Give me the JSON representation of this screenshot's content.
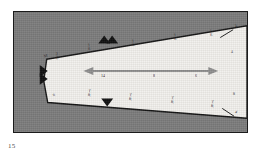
{
  "figure": {
    "caption": "15",
    "colors": {
      "background_field": "#7c7c7c",
      "wedge_fill": "#f2f0ec",
      "outline": "#141414",
      "frame": "#1b1b1b",
      "dimension_arrow": "#8e8e8e",
      "marker": "#101010",
      "label_text": "#22201f"
    },
    "shape": {
      "name": "tapered-wedge",
      "description": "light tapered wedge widening to the right on a dark gray field"
    }
  },
  "dimension_arrow": {
    "name": "overall-length-dimension",
    "labels": [
      {
        "text": "14",
        "x": 104,
        "y": 76
      },
      {
        "text": "8",
        "x": 156,
        "y": 76
      },
      {
        "text": "6",
        "x": 198,
        "y": 76
      }
    ]
  },
  "edge_markers": [
    {
      "name": "station-marker-top",
      "x": 108,
      "y": 41,
      "kind": "double-triangle"
    },
    {
      "name": "station-marker-left",
      "x": 46,
      "y": 72,
      "kind": "double-triangle"
    },
    {
      "name": "station-marker-bottom",
      "x": 110,
      "y": 106,
      "kind": "triangle"
    }
  ],
  "annotations": {
    "top_row": [
      {
        "text": "1\nE",
        "x": 92,
        "y": 47
      },
      {
        "text": "1\nE",
        "x": 136,
        "y": 43
      },
      {
        "text": "1\nE",
        "x": 178,
        "y": 37
      },
      {
        "text": "1\nE",
        "x": 214,
        "y": 33
      }
    ],
    "upper_mid_row": [
      {
        "text": "2\nE",
        "x": 60,
        "y": 56
      }
    ],
    "right_column": [
      {
        "text": "4",
        "x": 234,
        "y": 52
      },
      {
        "text": "8",
        "x": 236,
        "y": 94
      }
    ],
    "bottom_row": [
      {
        "text": "T\nR",
        "x": 92,
        "y": 93
      },
      {
        "text": "T\nR",
        "x": 133,
        "y": 97
      },
      {
        "text": "T\nR",
        "x": 175,
        "y": 100
      },
      {
        "text": "T\nR",
        "x": 215,
        "y": 104
      }
    ],
    "bottom_left": [
      {
        "text": "6",
        "x": 57,
        "y": 97
      }
    ],
    "left_corner": [
      {
        "text": "M",
        "x": 48,
        "y": 58
      }
    ]
  },
  "callouts": [
    {
      "name": "callout-top-right",
      "text": "2",
      "x": 238,
      "y": 26
    },
    {
      "name": "callout-bottom-right",
      "text": "4",
      "x": 238,
      "y": 112
    }
  ]
}
